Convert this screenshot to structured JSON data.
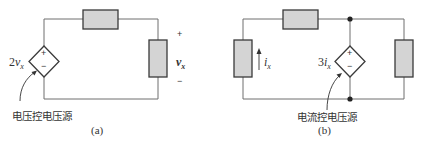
{
  "figure": {
    "panel_a": {
      "caption": "(a)",
      "source_label_coef": "2",
      "source_label_var": "v",
      "source_label_sub": "x",
      "source_plus": "+",
      "source_minus": "−",
      "output_plus": "+",
      "output_var": "v",
      "output_sub": "x",
      "output_minus": "−",
      "annotation": "电压控电压源"
    },
    "panel_b": {
      "caption": "(b)",
      "source_label_coef": "3",
      "source_label_var": "i",
      "source_label_sub": "x",
      "source_plus": "+",
      "source_minus": "−",
      "current_var": "i",
      "current_sub": "x",
      "annotation": "电流控电压源"
    },
    "colors": {
      "wire": "#6e6e6e",
      "resistor_fill": "#d4d4d4",
      "resistor_stroke": "#3a3a3a",
      "node": "#222222"
    }
  }
}
